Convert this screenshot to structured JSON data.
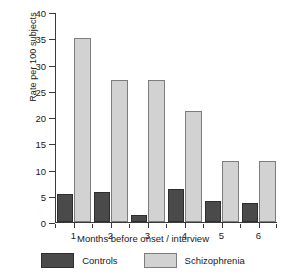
{
  "chart_data": {
    "type": "bar",
    "title": "",
    "xlabel": "Months before onset / interview",
    "ylabel": "Rate per 100 subjects",
    "categories": [
      "1",
      "2",
      "3",
      "4",
      "5",
      "6"
    ],
    "ylim": [
      0,
      40
    ],
    "yticks": [
      0,
      5,
      10,
      15,
      20,
      25,
      30,
      35,
      40
    ],
    "ytick_labels": [
      "0",
      "5",
      "10",
      "15",
      "20",
      "25",
      "30",
      "35",
      "40"
    ],
    "grid": false,
    "legend_position": "bottom",
    "series": [
      {
        "name": "Controls",
        "color": "#4a4a4a",
        "edge_color": "#2e2e2e",
        "values": [
          5.3,
          5.6,
          1.3,
          6.3,
          4.0,
          3.5
        ]
      },
      {
        "name": "Schizophrenia",
        "color": "#d2d2d2",
        "edge_color": "#7d7d7d",
        "values": [
          35,
          27,
          27,
          21,
          11.6,
          11.6
        ]
      }
    ]
  }
}
